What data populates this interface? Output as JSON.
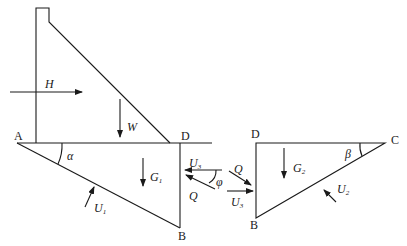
{
  "diagram": {
    "type": "free-body force diagram of gravity dam with wedge sliding",
    "points": {
      "A": "A",
      "B_left": "B",
      "D_left": "D",
      "D_right": "D",
      "B_right": "B",
      "C": "C"
    },
    "forces": {
      "H": "H",
      "W": "W",
      "G1": {
        "main": "G",
        "sub": "1"
      },
      "G2": {
        "main": "G",
        "sub": "2"
      },
      "U1": {
        "main": "U",
        "sub": "1"
      },
      "U2": {
        "main": "U",
        "sub": "2"
      },
      "U3_left": {
        "main": "U",
        "sub": "3"
      },
      "U3_right": {
        "main": "U",
        "sub": "3"
      },
      "Q_left": "Q",
      "Q_right": "Q"
    },
    "angles": {
      "alpha": "α",
      "beta": "β",
      "phi": "φ"
    },
    "colors": {
      "line": "#1a1a1a",
      "background": "#ffffff"
    }
  }
}
